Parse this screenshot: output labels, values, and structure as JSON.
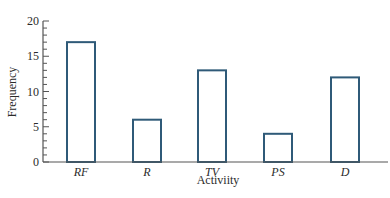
{
  "chart_data": {
    "type": "bar",
    "title": "",
    "xlabel": "Activiity",
    "ylabel": "Frequency",
    "categories": [
      "RF",
      "R",
      "TV",
      "PS",
      "D"
    ],
    "values": [
      17,
      6,
      13,
      4,
      12
    ],
    "ylim": [
      0,
      20
    ],
    "yticks": [
      0,
      5,
      10,
      15,
      20
    ],
    "minor_tick_step": 1,
    "grid": false,
    "legend": null,
    "bar_style": "outline",
    "colors": {
      "bar_outline": "#2f5a78",
      "axis": "#555555",
      "bar_fill": "#ffffff"
    }
  }
}
